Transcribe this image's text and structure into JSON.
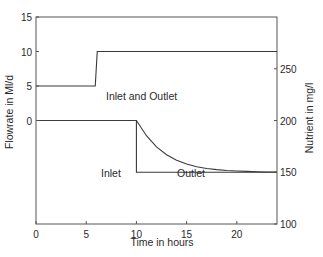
{
  "chart_data": {
    "type": "line",
    "title": "",
    "xlabel": "Time in hours",
    "ylabel_left": "Flowrate in Ml/d",
    "ylabel_right": "Nutrient in mg/l",
    "xlim": [
      0,
      24
    ],
    "ylim_left": [
      -15,
      15
    ],
    "ylim_right": [
      100,
      300
    ],
    "x_ticks": [
      0,
      5,
      10,
      15,
      20
    ],
    "y_ticks_left": [
      0,
      5,
      10,
      15
    ],
    "y_ticks_right": [
      100,
      150,
      200,
      250
    ],
    "grid": false,
    "series": [
      {
        "name": "Inlet and Outlet flowrate",
        "axis": "left",
        "x": [
          0,
          5.9,
          6.1,
          24
        ],
        "y": [
          5,
          5,
          10,
          10
        ]
      },
      {
        "name": "Inlet nutrient",
        "axis": "right",
        "x": [
          0,
          10,
          10,
          24
        ],
        "y": [
          200,
          200,
          150,
          150
        ]
      },
      {
        "name": "Outlet nutrient",
        "axis": "right",
        "x": [
          10,
          11,
          12,
          13,
          14,
          15,
          16,
          17,
          18,
          19,
          20,
          21,
          22,
          23,
          24
        ],
        "y": [
          200,
          185.3,
          174.5,
          166.9,
          161.6,
          158.0,
          155.3,
          153.6,
          152.5,
          151.7,
          151.2,
          150.8,
          150.5,
          150.3,
          150.2
        ]
      }
    ],
    "annotations": [
      {
        "text": "Inlet and Outlet",
        "x": 8.9,
        "y_left": 7.3
      },
      {
        "text": "Inlet",
        "x": 6.6,
        "y_right": 176
      },
      {
        "text": "Outlet",
        "x": 13.9,
        "y_right": 176
      }
    ]
  },
  "labels": {
    "xlabel": "Time in hours",
    "ylabel_left": "Flowrate in Ml/d",
    "ylabel_right": "Nutrient in mg/l",
    "ann_flow": "Inlet and Outlet",
    "ann_inlet": "Inlet",
    "ann_outlet": "Outlet"
  },
  "colors": {
    "line": "#3a3a3a",
    "axis": "#555555"
  }
}
